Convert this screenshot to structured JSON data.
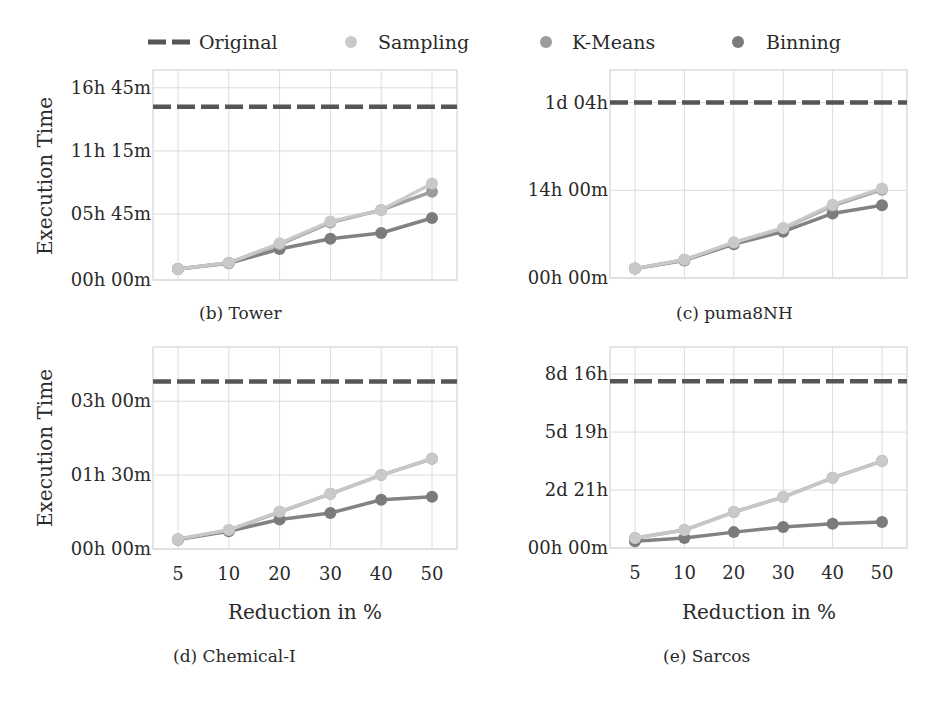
{
  "legend": {
    "items": [
      {
        "label": "Original",
        "style": "dashed-line",
        "color": "#555555"
      },
      {
        "label": "Sampling",
        "style": "marker",
        "color": "#c9c9c9"
      },
      {
        "label": "K-Means",
        "style": "marker",
        "color": "#9c9c9c"
      },
      {
        "label": "Binning",
        "style": "marker",
        "color": "#7b7b7b"
      }
    ]
  },
  "shared": {
    "ylabel": "Execution Time",
    "xlabel": "Reduction in %",
    "x_ticks": [
      "5",
      "10",
      "20",
      "30",
      "40",
      "50"
    ]
  },
  "chart_data": [
    {
      "type": "line",
      "title": "(b) Tower",
      "xlabel": "",
      "ylabel": "Execution Time",
      "unit": "hours",
      "categories": [
        "5",
        "10",
        "20",
        "30",
        "40",
        "50"
      ],
      "y_ticks": [
        {
          "value": 0,
          "label": "00h 00m"
        },
        {
          "value": 5.75,
          "label": "05h 45m"
        },
        {
          "value": 11.25,
          "label": "11h 15m"
        },
        {
          "value": 16.75,
          "label": "16h 45m"
        }
      ],
      "ylim": [
        0,
        18.3
      ],
      "grid": true,
      "original": 15.1,
      "series": [
        {
          "name": "Sampling",
          "values": [
            0.95,
            1.5,
            3.2,
            5.1,
            6.1,
            8.4
          ]
        },
        {
          "name": "K-Means",
          "values": [
            0.95,
            1.5,
            3.1,
            5.0,
            6.1,
            7.7
          ]
        },
        {
          "name": "Binning",
          "values": [
            0.95,
            1.45,
            2.7,
            3.6,
            4.1,
            5.4
          ]
        }
      ]
    },
    {
      "type": "line",
      "title": "(c) puma8NH",
      "xlabel": "",
      "ylabel": "",
      "unit": "hours",
      "categories": [
        "5",
        "10",
        "20",
        "30",
        "40",
        "50"
      ],
      "y_ticks": [
        {
          "value": 0,
          "label": "00h 00m"
        },
        {
          "value": 14,
          "label": "14h 00m"
        },
        {
          "value": 28,
          "label": "1d 04h"
        }
      ],
      "ylim": [
        0,
        33.2
      ],
      "grid": true,
      "original": 28.0,
      "series": [
        {
          "name": "Sampling",
          "values": [
            1.5,
            2.9,
            5.7,
            8.0,
            11.7,
            14.3
          ]
        },
        {
          "name": "K-Means",
          "values": [
            1.5,
            2.9,
            5.6,
            7.9,
            11.5,
            14.1
          ]
        },
        {
          "name": "Binning",
          "values": [
            1.5,
            2.8,
            5.4,
            7.4,
            10.3,
            11.6
          ]
        }
      ]
    },
    {
      "type": "line",
      "title": "(d) Chemical-I",
      "xlabel": "Reduction in %",
      "ylabel": "Execution Time",
      "unit": "hours",
      "categories": [
        "5",
        "10",
        "20",
        "30",
        "40",
        "50"
      ],
      "y_ticks": [
        {
          "value": 0,
          "label": "00h 00m"
        },
        {
          "value": 1.5,
          "label": "01h 30m"
        },
        {
          "value": 3.0,
          "label": "03h 00m"
        }
      ],
      "ylim": [
        0,
        4.1
      ],
      "grid": true,
      "original": 3.4,
      "series": [
        {
          "name": "Sampling",
          "values": [
            0.2,
            0.39,
            0.76,
            1.12,
            1.5,
            1.84
          ]
        },
        {
          "name": "K-Means",
          "values": [
            0.2,
            0.38,
            0.75,
            1.12,
            1.5,
            1.83
          ]
        },
        {
          "name": "Binning",
          "values": [
            0.19,
            0.36,
            0.6,
            0.73,
            1.0,
            1.06
          ]
        }
      ]
    },
    {
      "type": "line",
      "title": "(e) Sarcos",
      "xlabel": "Reduction in %",
      "ylabel": "",
      "unit": "hours",
      "categories": [
        "5",
        "10",
        "20",
        "30",
        "40",
        "50"
      ],
      "y_ticks": [
        {
          "value": 0,
          "label": "00h 00m"
        },
        {
          "value": 69.3,
          "label": "2d 21h"
        },
        {
          "value": 138.7,
          "label": "5d 19h"
        },
        {
          "value": 208,
          "label": "8d 16h"
        }
      ],
      "ylim": [
        0,
        240.5
      ],
      "grid": true,
      "original": 199.5,
      "series": [
        {
          "name": "Sampling",
          "values": [
            12,
            21.5,
            43,
            61,
            84,
            104
          ]
        },
        {
          "name": "K-Means",
          "values": [
            12,
            21.5,
            43,
            61,
            84,
            104
          ]
        },
        {
          "name": "Binning",
          "values": [
            8,
            12,
            19,
            25,
            29,
            31
          ]
        }
      ]
    }
  ],
  "panels": {
    "tower": {
      "caption": "(b) Tower"
    },
    "puma": {
      "caption": "(c) puma8NH"
    },
    "chemical": {
      "caption": "(d) Chemical-I",
      "xlabel": "Reduction in %"
    },
    "sarcos": {
      "caption": "(e) Sarcos",
      "xlabel": "Reduction in %"
    }
  }
}
